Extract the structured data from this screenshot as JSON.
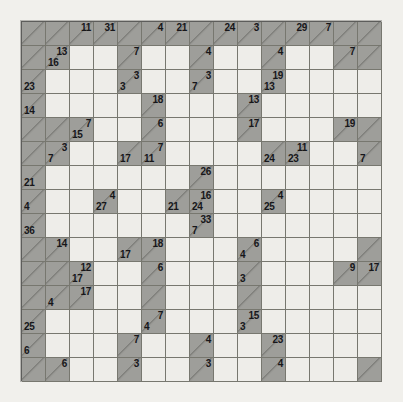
{
  "puzzle": {
    "name": "kakuro-grid",
    "type": "kakuro",
    "rows": 15,
    "cols": 15,
    "cell_size_px": 24,
    "colors": {
      "background": "#f1f0ec",
      "open_cell": "#eeede9",
      "clue_cell": "#9e9e9a",
      "grid_line": "#77776f",
      "text": "#17171a"
    },
    "legend": {
      "across_position": "top-right",
      "down_position": "bottom-left"
    },
    "cells": [
      [
        {
          "t": "b"
        },
        {
          "t": "b"
        },
        {
          "t": "c",
          "a": "11"
        },
        {
          "t": "c",
          "a": "31"
        },
        {
          "t": "b"
        },
        {
          "t": "c",
          "a": "4"
        },
        {
          "t": "c",
          "a": "21"
        },
        {
          "t": "b"
        },
        {
          "t": "c",
          "a": "24"
        },
        {
          "t": "c",
          "a": "3"
        },
        {
          "t": "b"
        },
        {
          "t": "c",
          "a": "29"
        },
        {
          "t": "c",
          "a": "7"
        },
        {
          "t": "b"
        },
        {
          "t": "b"
        }
      ],
      [
        {
          "t": "b"
        },
        {
          "t": "c",
          "a": "13",
          "d": "16"
        },
        {
          "t": "o"
        },
        {
          "t": "o"
        },
        {
          "t": "c",
          "a": "7"
        },
        {
          "t": "o"
        },
        {
          "t": "o"
        },
        {
          "t": "c",
          "a": "4"
        },
        {
          "t": "o"
        },
        {
          "t": "o"
        },
        {
          "t": "c",
          "a": "4"
        },
        {
          "t": "o"
        },
        {
          "t": "o"
        },
        {
          "t": "c",
          "a": "7"
        },
        {
          "t": "b"
        }
      ],
      [
        {
          "t": "c",
          "d": "23"
        },
        {
          "t": "o"
        },
        {
          "t": "o"
        },
        {
          "t": "o"
        },
        {
          "t": "c",
          "a": "3",
          "d": "3"
        },
        {
          "t": "o"
        },
        {
          "t": "o"
        },
        {
          "t": "c",
          "a": "3",
          "d": "7"
        },
        {
          "t": "o"
        },
        {
          "t": "o"
        },
        {
          "t": "c",
          "a": "19",
          "d": "13"
        },
        {
          "t": "o"
        },
        {
          "t": "o"
        },
        {
          "t": "o"
        },
        {
          "t": "o"
        }
      ],
      [
        {
          "t": "c",
          "d": "14"
        },
        {
          "t": "o"
        },
        {
          "t": "o"
        },
        {
          "t": "o"
        },
        {
          "t": "o"
        },
        {
          "t": "c",
          "a": "18"
        },
        {
          "t": "o"
        },
        {
          "t": "o"
        },
        {
          "t": "o"
        },
        {
          "t": "c",
          "a": "13"
        },
        {
          "t": "o"
        },
        {
          "t": "o"
        },
        {
          "t": "o"
        },
        {
          "t": "o"
        },
        {
          "t": "o"
        }
      ],
      [
        {
          "t": "b"
        },
        {
          "t": "b"
        },
        {
          "t": "c",
          "a": "7",
          "d": "15"
        },
        {
          "t": "o"
        },
        {
          "t": "o"
        },
        {
          "t": "c",
          "a": "6"
        },
        {
          "t": "o"
        },
        {
          "t": "o"
        },
        {
          "t": "o"
        },
        {
          "t": "c",
          "a": "17"
        },
        {
          "t": "o"
        },
        {
          "t": "o"
        },
        {
          "t": "o"
        },
        {
          "t": "c",
          "a": "19"
        },
        {
          "t": "b"
        }
      ],
      [
        {
          "t": "b"
        },
        {
          "t": "c",
          "a": "3",
          "d": "7"
        },
        {
          "t": "o"
        },
        {
          "t": "o"
        },
        {
          "t": "c",
          "d": "17"
        },
        {
          "t": "c",
          "a": "7",
          "d": "11"
        },
        {
          "t": "o"
        },
        {
          "t": "o"
        },
        {
          "t": "o"
        },
        {
          "t": "o"
        },
        {
          "t": "c",
          "d": "24"
        },
        {
          "t": "c",
          "a": "11",
          "d": "23"
        },
        {
          "t": "o"
        },
        {
          "t": "o"
        },
        {
          "t": "c",
          "d": "7"
        }
      ],
      [
        {
          "t": "c",
          "d": "21"
        },
        {
          "t": "o"
        },
        {
          "t": "o"
        },
        {
          "t": "o"
        },
        {
          "t": "o"
        },
        {
          "t": "o"
        },
        {
          "t": "o"
        },
        {
          "t": "c",
          "a": "26"
        },
        {
          "t": "o"
        },
        {
          "t": "o"
        },
        {
          "t": "o"
        },
        {
          "t": "o"
        },
        {
          "t": "o"
        },
        {
          "t": "o"
        },
        {
          "t": "o"
        }
      ],
      [
        {
          "t": "c",
          "d": "4"
        },
        {
          "t": "o"
        },
        {
          "t": "o"
        },
        {
          "t": "c",
          "a": "4",
          "d": "27"
        },
        {
          "t": "o"
        },
        {
          "t": "o"
        },
        {
          "t": "c",
          "d": "21"
        },
        {
          "t": "c",
          "a": "16",
          "d": "24"
        },
        {
          "t": "o"
        },
        {
          "t": "o"
        },
        {
          "t": "c",
          "a": "4",
          "d": "25"
        },
        {
          "t": "o"
        },
        {
          "t": "o"
        },
        {
          "t": "o"
        },
        {
          "t": "o"
        }
      ],
      [
        {
          "t": "c",
          "d": "36"
        },
        {
          "t": "o"
        },
        {
          "t": "o"
        },
        {
          "t": "o"
        },
        {
          "t": "o"
        },
        {
          "t": "o"
        },
        {
          "t": "o"
        },
        {
          "t": "c",
          "a": "33",
          "d": "7"
        },
        {
          "t": "o"
        },
        {
          "t": "o"
        },
        {
          "t": "o"
        },
        {
          "t": "o"
        },
        {
          "t": "o"
        },
        {
          "t": "o"
        },
        {
          "t": "o"
        }
      ],
      [
        {
          "t": "b"
        },
        {
          "t": "c",
          "a": "14"
        },
        {
          "t": "o"
        },
        {
          "t": "o"
        },
        {
          "t": "c",
          "d": "17"
        },
        {
          "t": "c",
          "a": "18"
        },
        {
          "t": "o"
        },
        {
          "t": "o"
        },
        {
          "t": "o"
        },
        {
          "t": "c",
          "a": "6",
          "d": "4"
        },
        {
          "t": "o"
        },
        {
          "t": "o"
        },
        {
          "t": "o"
        },
        {
          "t": "o"
        },
        {
          "t": "b"
        }
      ],
      [
        {
          "t": "b"
        },
        {
          "t": "b"
        },
        {
          "t": "c",
          "a": "12",
          "d": "17"
        },
        {
          "t": "o"
        },
        {
          "t": "o"
        },
        {
          "t": "c",
          "a": "6"
        },
        {
          "t": "o"
        },
        {
          "t": "o"
        },
        {
          "t": "o"
        },
        {
          "t": "c",
          "d": "3"
        },
        {
          "t": "o"
        },
        {
          "t": "o"
        },
        {
          "t": "o"
        },
        {
          "t": "c",
          "a": "9"
        },
        {
          "t": "c",
          "a": "17"
        }
      ],
      [
        {
          "t": "b"
        },
        {
          "t": "c",
          "d": "4"
        },
        {
          "t": "c",
          "a": "17"
        },
        {
          "t": "o"
        },
        {
          "t": "o"
        },
        {
          "t": "b"
        },
        {
          "t": "o"
        },
        {
          "t": "o"
        },
        {
          "t": "o"
        },
        {
          "t": "b"
        },
        {
          "t": "o"
        },
        {
          "t": "o"
        },
        {
          "t": "o"
        },
        {
          "t": "o"
        },
        {
          "t": "o"
        }
      ],
      [
        {
          "t": "c",
          "d": "25"
        },
        {
          "t": "o"
        },
        {
          "t": "o"
        },
        {
          "t": "o"
        },
        {
          "t": "o"
        },
        {
          "t": "c",
          "a": "7",
          "d": "4"
        },
        {
          "t": "o"
        },
        {
          "t": "o"
        },
        {
          "t": "o"
        },
        {
          "t": "c",
          "a": "15",
          "d": "3"
        },
        {
          "t": "o"
        },
        {
          "t": "o"
        },
        {
          "t": "o"
        },
        {
          "t": "o"
        },
        {
          "t": "o"
        }
      ],
      [
        {
          "t": "c",
          "d": "6"
        },
        {
          "t": "o"
        },
        {
          "t": "o"
        },
        {
          "t": "o"
        },
        {
          "t": "c",
          "a": "7"
        },
        {
          "t": "o"
        },
        {
          "t": "o"
        },
        {
          "t": "c",
          "a": "4"
        },
        {
          "t": "o"
        },
        {
          "t": "o"
        },
        {
          "t": "c",
          "a": "23"
        },
        {
          "t": "o"
        },
        {
          "t": "o"
        },
        {
          "t": "o"
        },
        {
          "t": "o"
        }
      ],
      [
        {
          "t": "b"
        },
        {
          "t": "c",
          "a": "6"
        },
        {
          "t": "o"
        },
        {
          "t": "o"
        },
        {
          "t": "c",
          "a": "3"
        },
        {
          "t": "o"
        },
        {
          "t": "o"
        },
        {
          "t": "c",
          "a": "3"
        },
        {
          "t": "o"
        },
        {
          "t": "o"
        },
        {
          "t": "c",
          "a": "4"
        },
        {
          "t": "o"
        },
        {
          "t": "o"
        },
        {
          "t": "o"
        },
        {
          "t": "b"
        }
      ]
    ]
  }
}
